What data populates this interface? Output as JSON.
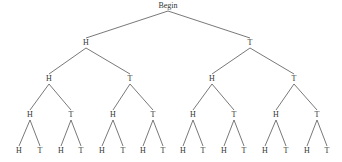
{
  "root": {
    "label": "Begin",
    "x": 168,
    "y": 6
  },
  "nodes": [
    {
      "id": "1",
      "label": "H",
      "x": 86,
      "y": 43,
      "parent": "root"
    },
    {
      "id": "2",
      "label": "T",
      "x": 250,
      "y": 43,
      "parent": "root"
    },
    {
      "id": "11",
      "label": "H",
      "x": 49,
      "y": 79,
      "parent": "1"
    },
    {
      "id": "12",
      "label": "T",
      "x": 130,
      "y": 79,
      "parent": "1"
    },
    {
      "id": "21",
      "label": "H",
      "x": 212,
      "y": 79,
      "parent": "2"
    },
    {
      "id": "22",
      "label": "T",
      "x": 294,
      "y": 79,
      "parent": "2"
    },
    {
      "id": "111",
      "label": "H",
      "x": 30,
      "y": 115,
      "parent": "11"
    },
    {
      "id": "112",
      "label": "T",
      "x": 71,
      "y": 115,
      "parent": "11"
    },
    {
      "id": "121",
      "label": "H",
      "x": 113,
      "y": 115,
      "parent": "12"
    },
    {
      "id": "122",
      "label": "T",
      "x": 153,
      "y": 115,
      "parent": "12"
    },
    {
      "id": "211",
      "label": "H",
      "x": 193,
      "y": 115,
      "parent": "21"
    },
    {
      "id": "212",
      "label": "T",
      "x": 234,
      "y": 115,
      "parent": "21"
    },
    {
      "id": "221",
      "label": "H",
      "x": 276,
      "y": 115,
      "parent": "22"
    },
    {
      "id": "222",
      "label": "T",
      "x": 317,
      "y": 115,
      "parent": "22"
    },
    {
      "id": "1111",
      "label": "H",
      "x": 19,
      "y": 151,
      "parent": "111"
    },
    {
      "id": "1112",
      "label": "T",
      "x": 40,
      "y": 151,
      "parent": "111"
    },
    {
      "id": "1121",
      "label": "H",
      "x": 61,
      "y": 151,
      "parent": "112"
    },
    {
      "id": "1122",
      "label": "T",
      "x": 81,
      "y": 151,
      "parent": "112"
    },
    {
      "id": "1211",
      "label": "H",
      "x": 102,
      "y": 151,
      "parent": "121"
    },
    {
      "id": "1212",
      "label": "T",
      "x": 123,
      "y": 151,
      "parent": "121"
    },
    {
      "id": "1221",
      "label": "H",
      "x": 143,
      "y": 151,
      "parent": "122"
    },
    {
      "id": "1222",
      "label": "T",
      "x": 163,
      "y": 151,
      "parent": "122"
    },
    {
      "id": "2111",
      "label": "H",
      "x": 183,
      "y": 151,
      "parent": "211"
    },
    {
      "id": "2112",
      "label": "T",
      "x": 203,
      "y": 151,
      "parent": "211"
    },
    {
      "id": "2121",
      "label": "H",
      "x": 224,
      "y": 151,
      "parent": "212"
    },
    {
      "id": "2122",
      "label": "T",
      "x": 244,
      "y": 151,
      "parent": "212"
    },
    {
      "id": "2211",
      "label": "H",
      "x": 265,
      "y": 151,
      "parent": "221"
    },
    {
      "id": "2212",
      "label": "T",
      "x": 286,
      "y": 151,
      "parent": "221"
    },
    {
      "id": "2221",
      "label": "H",
      "x": 307,
      "y": 151,
      "parent": "222"
    },
    {
      "id": "2222",
      "label": "T",
      "x": 327,
      "y": 151,
      "parent": "222"
    }
  ],
  "line_color": "#555555"
}
